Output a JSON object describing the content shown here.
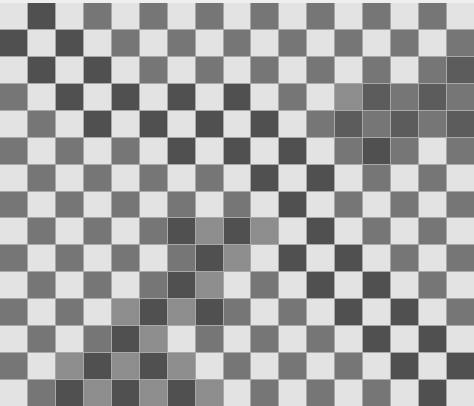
{
  "image": {
    "description": "Grayscale checkerboard pattern with diagonal shadow bands",
    "columns": 17,
    "rows": 15,
    "palette": {
      "L": "#e3e3e3",
      "S": "#8d8d8d",
      "M": "#767676",
      "D": "#505050",
      "X": "#5c5c5c"
    },
    "grid": [
      "LDLMLMLMLMLMLMLML",
      "DLDLMLMLMLMLMLMLM",
      "LDLDLMLMLMLMLMLMX",
      "MLDLDLDLDLMLSXMXM",
      "LMLDLDLDLDLMXMXMX",
      "MLMLMLDLDLDLMDMLM",
      "LMLMLMLMLDLDLMLML",
      "MLMLMLMLMLDLMLMLM",
      "LMLMLMDSDSLDLMLML",
      "MLMLMLMDSLDLDLMLM",
      "LMLMLMDSLMLDLDLML",
      "MLMLSDSDMLMLDLDLM",
      "LMLMDSLMLMLMLDLDL",
      "MLSDSDSLMLMLMLDLD",
      "LMDSDSDSLMLMLMLDL"
    ]
  }
}
